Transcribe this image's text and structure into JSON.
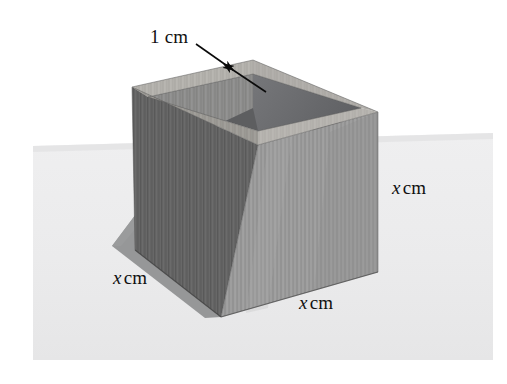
{
  "figure": {
    "type": "geometry-diagram",
    "labels": {
      "thickness": {
        "value": "1",
        "unit": "cm",
        "text": "1 cm",
        "role": "wall-thickness"
      },
      "height": {
        "variable": "x",
        "unit": "cm",
        "text": "x cm",
        "role": "height"
      },
      "depth": {
        "variable": "x",
        "unit": "cm",
        "text": "x cm",
        "role": "depth"
      },
      "width": {
        "variable": "x",
        "unit": "cm",
        "text": "x cm",
        "role": "width"
      }
    },
    "colors": {
      "background": "#ffffff",
      "ground": "#ececed",
      "shadow": "#8f9091",
      "wood_left_face": "#6c6c6c",
      "wood_front_face": "#9a9a9a",
      "wood_rim_top": "#b3b1ac",
      "wood_inner_back": "#8d8d8c",
      "wood_inner_shadow": "#6e6f70",
      "arrow": "#0a0a0a"
    },
    "geometry": {
      "rim_outer_top": [
        253,
        60
      ],
      "rim_outer_left": [
        132,
        87
      ],
      "rim_outer_right": [
        378,
        112
      ],
      "rim_outer_front": [
        258,
        145
      ],
      "body_bottom_left": [
        135,
        250
      ],
      "body_bottom_front": [
        221,
        317
      ],
      "body_bottom_right": [
        378,
        272
      ],
      "ground_quad": [
        [
          33,
          145
        ],
        [
          493,
          133
        ],
        [
          493,
          360
        ],
        [
          33,
          360
        ]
      ]
    }
  },
  "annotations": {
    "arrow_upper": {
      "from": [
        196,
        47
      ],
      "to": [
        232,
        71
      ],
      "points_to": "outer top edge of rim"
    },
    "arrow_lower": {
      "from": [
        262,
        90
      ],
      "to": [
        223,
        64
      ],
      "points_to": "inner top edge of rim"
    }
  }
}
